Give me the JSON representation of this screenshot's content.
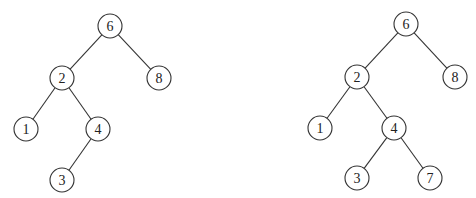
{
  "diagram": {
    "type": "binary-search-tree-comparison",
    "node_radius": 12,
    "colors": {
      "stroke": "#333333",
      "fill": "#ffffff",
      "text": "#222222"
    },
    "trees": [
      {
        "id": "left",
        "nodes": [
          {
            "id": "L6",
            "label": "6",
            "x": 110,
            "y": 26
          },
          {
            "id": "L2",
            "label": "2",
            "x": 62,
            "y": 78
          },
          {
            "id": "L8",
            "label": "8",
            "x": 159,
            "y": 78
          },
          {
            "id": "L1",
            "label": "1",
            "x": 26,
            "y": 129
          },
          {
            "id": "L4",
            "label": "4",
            "x": 98,
            "y": 129
          },
          {
            "id": "L3",
            "label": "3",
            "x": 62,
            "y": 180
          }
        ],
        "edges": [
          [
            "L6",
            "L2"
          ],
          [
            "L6",
            "L8"
          ],
          [
            "L2",
            "L1"
          ],
          [
            "L2",
            "L4"
          ],
          [
            "L4",
            "L3"
          ]
        ]
      },
      {
        "id": "right",
        "nodes": [
          {
            "id": "R6",
            "label": "6",
            "x": 406,
            "y": 24
          },
          {
            "id": "R2",
            "label": "2",
            "x": 357,
            "y": 77
          },
          {
            "id": "R8",
            "label": "8",
            "x": 455,
            "y": 77
          },
          {
            "id": "R1",
            "label": "1",
            "x": 320,
            "y": 128
          },
          {
            "id": "R4",
            "label": "4",
            "x": 394,
            "y": 128
          },
          {
            "id": "R3",
            "label": "3",
            "x": 357,
            "y": 178
          },
          {
            "id": "R7",
            "label": "7",
            "x": 430,
            "y": 178
          }
        ],
        "edges": [
          [
            "R6",
            "R2"
          ],
          [
            "R6",
            "R8"
          ],
          [
            "R2",
            "R1"
          ],
          [
            "R2",
            "R4"
          ],
          [
            "R4",
            "R3"
          ],
          [
            "R4",
            "R7"
          ]
        ]
      }
    ]
  }
}
